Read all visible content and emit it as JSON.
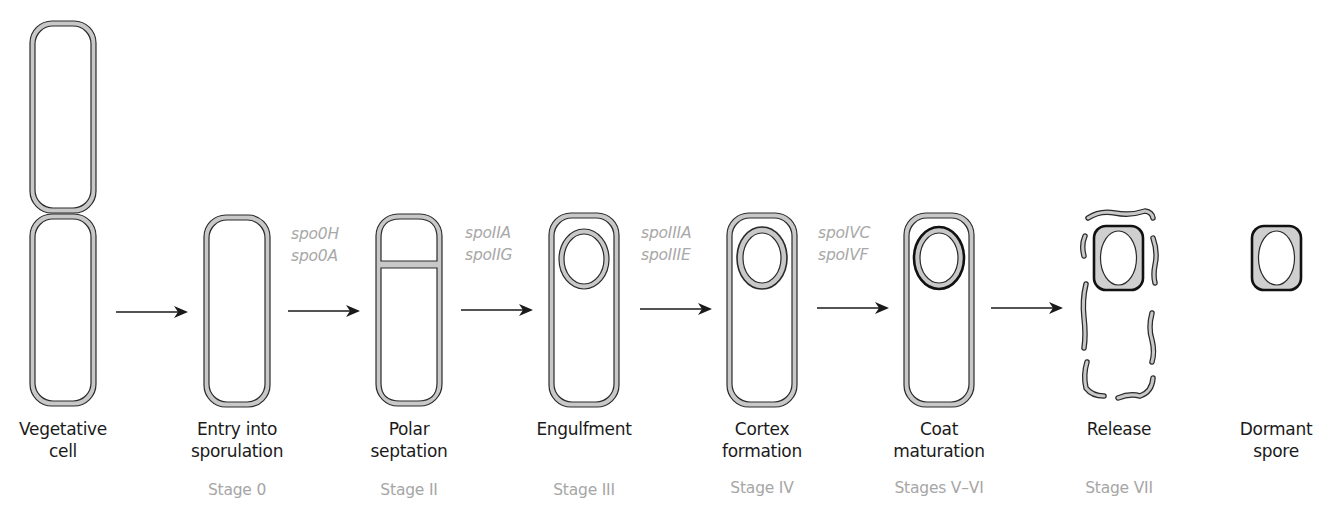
{
  "colors": {
    "outline": "#2a2a2a",
    "wall_fill": "#c8c8c8",
    "coat_fill": "#cfcfcf",
    "label_text": "#1a1a1a",
    "stage_text": "#a6a6a6",
    "gene_text": "#a8a8a8",
    "arrow": "#1a1a1a"
  },
  "stages": [
    {
      "id": "vegetative",
      "label_line1": "Vegetative",
      "label_line2": "cell",
      "stage": ""
    },
    {
      "id": "entry",
      "label_line1": "Entry into",
      "label_line2": "sporulation",
      "stage": "Stage 0"
    },
    {
      "id": "polar",
      "label_line1": "Polar",
      "label_line2": "septation",
      "stage": "Stage II"
    },
    {
      "id": "engulfment",
      "label_line1": "Engulfment",
      "label_line2": "",
      "stage": "Stage III"
    },
    {
      "id": "cortex",
      "label_line1": "Cortex",
      "label_line2": "formation",
      "stage": "Stage IV"
    },
    {
      "id": "coat",
      "label_line1": "Coat",
      "label_line2": "maturation",
      "stage": "Stages V–VI"
    },
    {
      "id": "release",
      "label_line1": "Release",
      "label_line2": "",
      "stage": "Stage VII"
    },
    {
      "id": "dormant",
      "label_line1": "Dormant",
      "label_line2": "spore",
      "stage": ""
    }
  ],
  "transitions": [
    {
      "from": "vegetative",
      "to": "entry",
      "genes": []
    },
    {
      "from": "entry",
      "to": "polar",
      "genes": [
        "spo0H",
        "spo0A"
      ]
    },
    {
      "from": "polar",
      "to": "engulfment",
      "genes": [
        "spoIIA",
        "spoIIG"
      ]
    },
    {
      "from": "engulfment",
      "to": "cortex",
      "genes": [
        "spoIIIA",
        "spoIIIE"
      ]
    },
    {
      "from": "cortex",
      "to": "coat",
      "genes": [
        "spoIVC",
        "spoIVF"
      ]
    },
    {
      "from": "coat",
      "to": "release",
      "genes": []
    }
  ]
}
